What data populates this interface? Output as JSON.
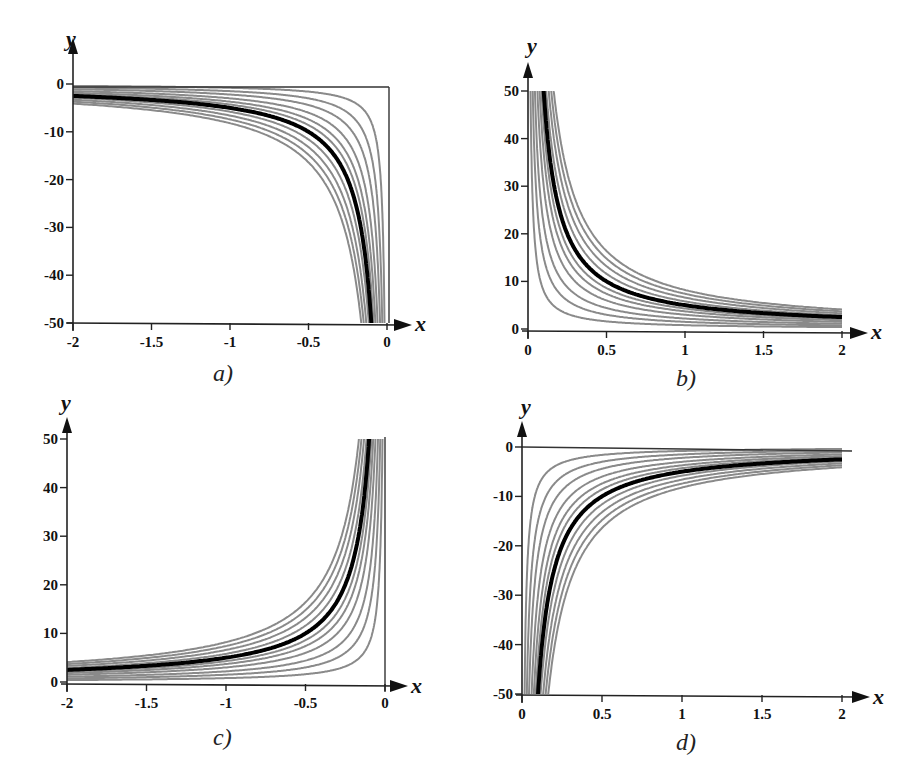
{
  "figure": {
    "panels": [
      {
        "id": "a",
        "label": "a)"
      },
      {
        "id": "b",
        "label": "b)"
      },
      {
        "id": "c",
        "label": "c)"
      },
      {
        "id": "d",
        "label": "d)"
      }
    ]
  },
  "chart_data": [
    {
      "panel": "a",
      "type": "line",
      "title": "a)",
      "xlabel": "x",
      "ylabel": "y",
      "xlim": [
        -2,
        0
      ],
      "ylim": [
        -50,
        0
      ],
      "xticks": [
        "-2",
        "-1.5",
        "-1",
        "-0.5",
        "0"
      ],
      "yticks": [
        "0",
        "-10",
        "-20",
        "-30",
        "-40",
        "-50"
      ],
      "grid": false,
      "frame_lines": [
        "top y=0 line",
        "right x=0 line"
      ],
      "family": "y = k/x (x<0)",
      "k_values": [
        0.8,
        1.5,
        2.2,
        3.0,
        3.7,
        4.3,
        5.0,
        5.8,
        6.6,
        7.4,
        8.2
      ],
      "highlighted_k": 5.0,
      "series_note": "gray thin curves, one thick black curve"
    },
    {
      "panel": "b",
      "type": "line",
      "title": "b)",
      "xlabel": "x",
      "ylabel": "y",
      "xlim": [
        0,
        2
      ],
      "ylim": [
        0,
        50
      ],
      "xticks": [
        "0",
        "0.5",
        "1",
        "1.5",
        "2"
      ],
      "yticks": [
        "50",
        "40",
        "30",
        "20",
        "10",
        "0"
      ],
      "grid": false,
      "family": "y = k/x (x>0)",
      "k_values": [
        0.8,
        1.5,
        2.2,
        3.0,
        3.7,
        4.3,
        5.0,
        5.8,
        6.6,
        7.4,
        8.2
      ],
      "highlighted_k": 5.0,
      "series_note": "gray thin curves, one thick black curve"
    },
    {
      "panel": "c",
      "type": "line",
      "title": "c)",
      "xlabel": "x",
      "ylabel": "y",
      "xlim": [
        -2,
        0
      ],
      "ylim": [
        0,
        50
      ],
      "xticks": [
        "-2",
        "-1.5",
        "-1",
        "-0.5",
        "0"
      ],
      "yticks": [
        "50",
        "40",
        "30",
        "20",
        "10",
        "0"
      ],
      "grid": false,
      "frame_lines": [
        "right x=0 line"
      ],
      "family": "y = -k/x (x<0)",
      "k_values": [
        0.8,
        1.5,
        2.2,
        3.0,
        3.7,
        4.3,
        5.0,
        5.8,
        6.6,
        7.4,
        8.2
      ],
      "highlighted_k": 5.0,
      "series_note": "gray thin curves, one thick black curve"
    },
    {
      "panel": "d",
      "type": "line",
      "title": "d)",
      "xlabel": "x",
      "ylabel": "y",
      "xlim": [
        0,
        2
      ],
      "ylim": [
        -50,
        0
      ],
      "xticks": [
        "0",
        "0.5",
        "1",
        "1.5",
        "2"
      ],
      "yticks": [
        "0",
        "-10",
        "-20",
        "-30",
        "-40",
        "-50"
      ],
      "grid": false,
      "frame_lines": [
        "top y=0 line"
      ],
      "family": "y = -k/x (x>0)",
      "k_values": [
        0.8,
        1.5,
        2.2,
        3.0,
        3.7,
        4.3,
        5.0,
        5.8,
        6.6,
        7.4,
        8.2
      ],
      "highlighted_k": 5.0,
      "series_note": "gray thin curves, one thick black curve"
    }
  ]
}
